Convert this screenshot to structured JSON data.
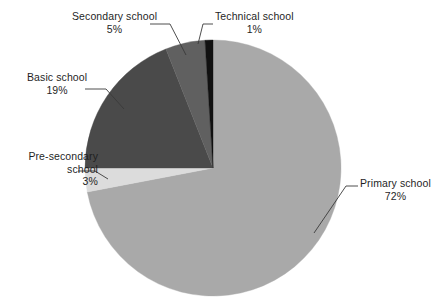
{
  "chart_data": {
    "type": "pie",
    "title": "",
    "categories": [
      "Primary school",
      "Pre-secondary school",
      "Basic school",
      "Secondary school",
      "Technical school"
    ],
    "values": [
      72,
      3,
      19,
      5,
      1
    ],
    "value_unit": "%",
    "start_angle_deg": 0,
    "direction": "clockwise",
    "legend": "none",
    "labels_position": "outside-with-leader-lines",
    "slices": [
      {
        "name": "Primary school",
        "percent": 72,
        "label": "Primary school",
        "value_label": "72%",
        "color": "#a9a9a9",
        "start_deg": 0,
        "sweep_deg": 259.2
      },
      {
        "name": "Pre-secondary school",
        "percent": 3,
        "label": "Pre-secondary school",
        "value_label": "3%",
        "color": "#dcdcdc",
        "start_deg": 259.2,
        "sweep_deg": 10.8
      },
      {
        "name": "Basic school",
        "percent": 19,
        "label": "Basic school",
        "value_label": "19%",
        "color": "#4a4a4a",
        "start_deg": 270.0,
        "sweep_deg": 68.4
      },
      {
        "name": "Secondary school",
        "percent": 5,
        "label": "Secondary school",
        "value_label": "5%",
        "color": "#606060",
        "start_deg": 338.4,
        "sweep_deg": 18.0
      },
      {
        "name": "Technical school",
        "percent": 1,
        "label": "Technical school",
        "value_label": "1%",
        "color": "#111111",
        "start_deg": 356.4,
        "sweep_deg": 3.6
      }
    ]
  },
  "labels": {
    "secondary": {
      "line1": "Secondary school",
      "line2": "5%"
    },
    "technical": {
      "line1": "Technical school",
      "line2": "1%"
    },
    "basic": {
      "line1": "Basic school",
      "line2": "19%"
    },
    "presecondary": {
      "line1": "Pre-secondary",
      "line2": "school",
      "line3": "3%"
    },
    "primary": {
      "line1": "Primary school",
      "line2": "72%"
    }
  },
  "colors": {
    "background": "#ffffff",
    "text": "#1f1f1f",
    "leader_line": "#3a3a3a",
    "primary_slice": "#a9a9a9",
    "presecondary_slice": "#dcdcdc",
    "basic_slice": "#4a4a4a",
    "secondary_slice": "#606060",
    "technical_slice": "#111111"
  },
  "geometry": {
    "center_x": 213,
    "center_y": 168,
    "radius": 128
  }
}
